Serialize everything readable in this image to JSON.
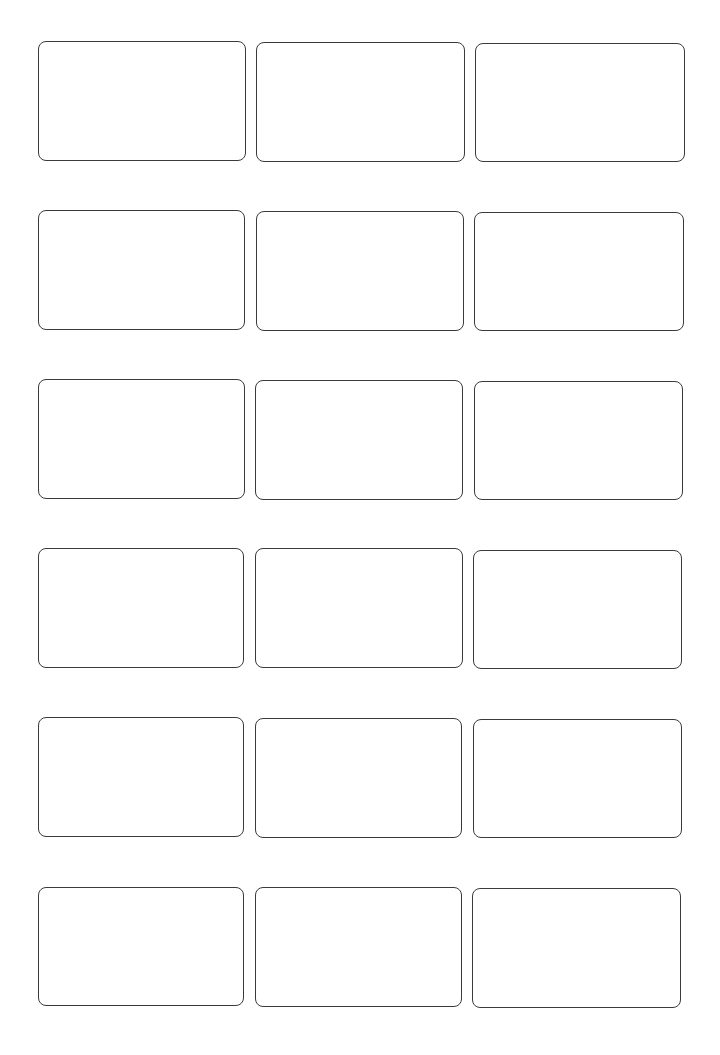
{
  "sheet": {
    "type": "label-template",
    "columns": 3,
    "rows": 6,
    "border_color": "#3a3a3a",
    "background": "#ffffff",
    "labels": [
      {
        "row": 1,
        "col": 1,
        "x": 38,
        "y": 41,
        "w": 208,
        "h": 120
      },
      {
        "row": 1,
        "col": 2,
        "x": 256,
        "y": 42,
        "w": 209,
        "h": 120
      },
      {
        "row": 1,
        "col": 3,
        "x": 475,
        "y": 43,
        "w": 210,
        "h": 119
      },
      {
        "row": 2,
        "col": 1,
        "x": 38,
        "y": 210,
        "w": 207,
        "h": 120
      },
      {
        "row": 2,
        "col": 2,
        "x": 256,
        "y": 211,
        "w": 208,
        "h": 120
      },
      {
        "row": 2,
        "col": 3,
        "x": 474,
        "y": 212,
        "w": 210,
        "h": 119
      },
      {
        "row": 3,
        "col": 1,
        "x": 38,
        "y": 379,
        "w": 207,
        "h": 120
      },
      {
        "row": 3,
        "col": 2,
        "x": 255,
        "y": 380,
        "w": 208,
        "h": 120
      },
      {
        "row": 3,
        "col": 3,
        "x": 474,
        "y": 381,
        "w": 209,
        "h": 119
      },
      {
        "row": 4,
        "col": 1,
        "x": 38,
        "y": 548,
        "w": 206,
        "h": 120
      },
      {
        "row": 4,
        "col": 2,
        "x": 255,
        "y": 548,
        "w": 208,
        "h": 120
      },
      {
        "row": 4,
        "col": 3,
        "x": 473,
        "y": 550,
        "w": 209,
        "h": 119
      },
      {
        "row": 5,
        "col": 1,
        "x": 38,
        "y": 717,
        "w": 206,
        "h": 120
      },
      {
        "row": 5,
        "col": 2,
        "x": 255,
        "y": 718,
        "w": 207,
        "h": 120
      },
      {
        "row": 5,
        "col": 3,
        "x": 473,
        "y": 719,
        "w": 209,
        "h": 119
      },
      {
        "row": 6,
        "col": 1,
        "x": 38,
        "y": 887,
        "w": 206,
        "h": 119
      },
      {
        "row": 6,
        "col": 2,
        "x": 255,
        "y": 887,
        "w": 207,
        "h": 120
      },
      {
        "row": 6,
        "col": 3,
        "x": 472,
        "y": 888,
        "w": 209,
        "h": 120
      }
    ]
  }
}
